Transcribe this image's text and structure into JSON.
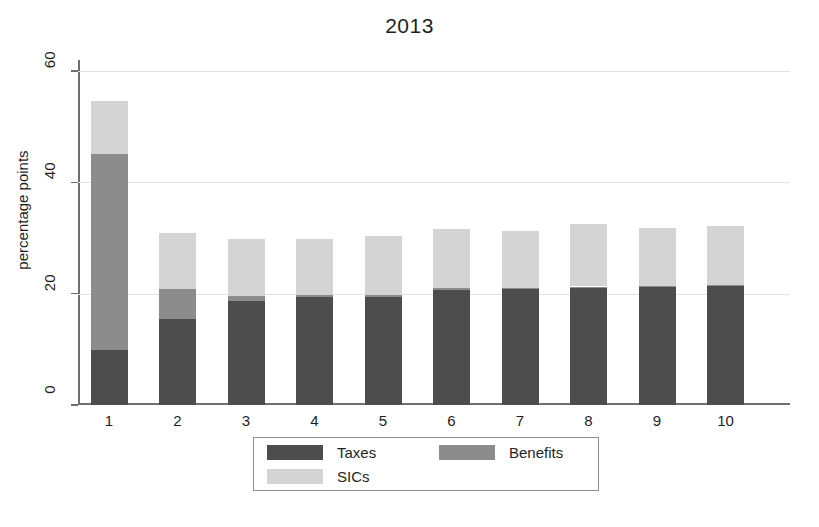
{
  "chart_data": {
    "type": "bar",
    "subtype": "stacked-vertical",
    "title": "2013",
    "xlabel": "",
    "ylabel": "percentage points",
    "categories": [
      "1",
      "2",
      "3",
      "4",
      "5",
      "6",
      "7",
      "8",
      "9",
      "10"
    ],
    "ylim": [
      0,
      62
    ],
    "yticks": [
      0,
      20,
      40,
      60
    ],
    "ytick_labels": [
      "0",
      "20",
      "40",
      "60"
    ],
    "grid": "horizontal",
    "legend_position": "bottom-center",
    "series": [
      {
        "name": "Taxes",
        "color": "#4d4d4d",
        "values": [
          9.9,
          15.5,
          18.7,
          19.4,
          19.4,
          20.6,
          20.8,
          21.0,
          21.2,
          21.3
        ]
      },
      {
        "name": "Benefits",
        "color": "#8c8c8c",
        "values": [
          35.2,
          5.3,
          0.9,
          0.4,
          0.4,
          0.4,
          0.3,
          0.3,
          0.2,
          0.2
        ]
      },
      {
        "name": "SICs",
        "color": "#d4d4d4",
        "values": [
          9.6,
          10.1,
          10.2,
          10.1,
          10.5,
          10.7,
          10.2,
          11.2,
          10.5,
          10.7
        ]
      }
    ],
    "totals": [
      54.7,
      30.9,
      29.8,
      29.9,
      30.3,
      31.7,
      31.3,
      32.5,
      31.9,
      32.2
    ]
  },
  "legend": {
    "items": [
      {
        "label": "Taxes",
        "color": "#4d4d4d"
      },
      {
        "label": "Benefits",
        "color": "#8c8c8c"
      },
      {
        "label": "SICs",
        "color": "#d4d4d4"
      }
    ]
  }
}
